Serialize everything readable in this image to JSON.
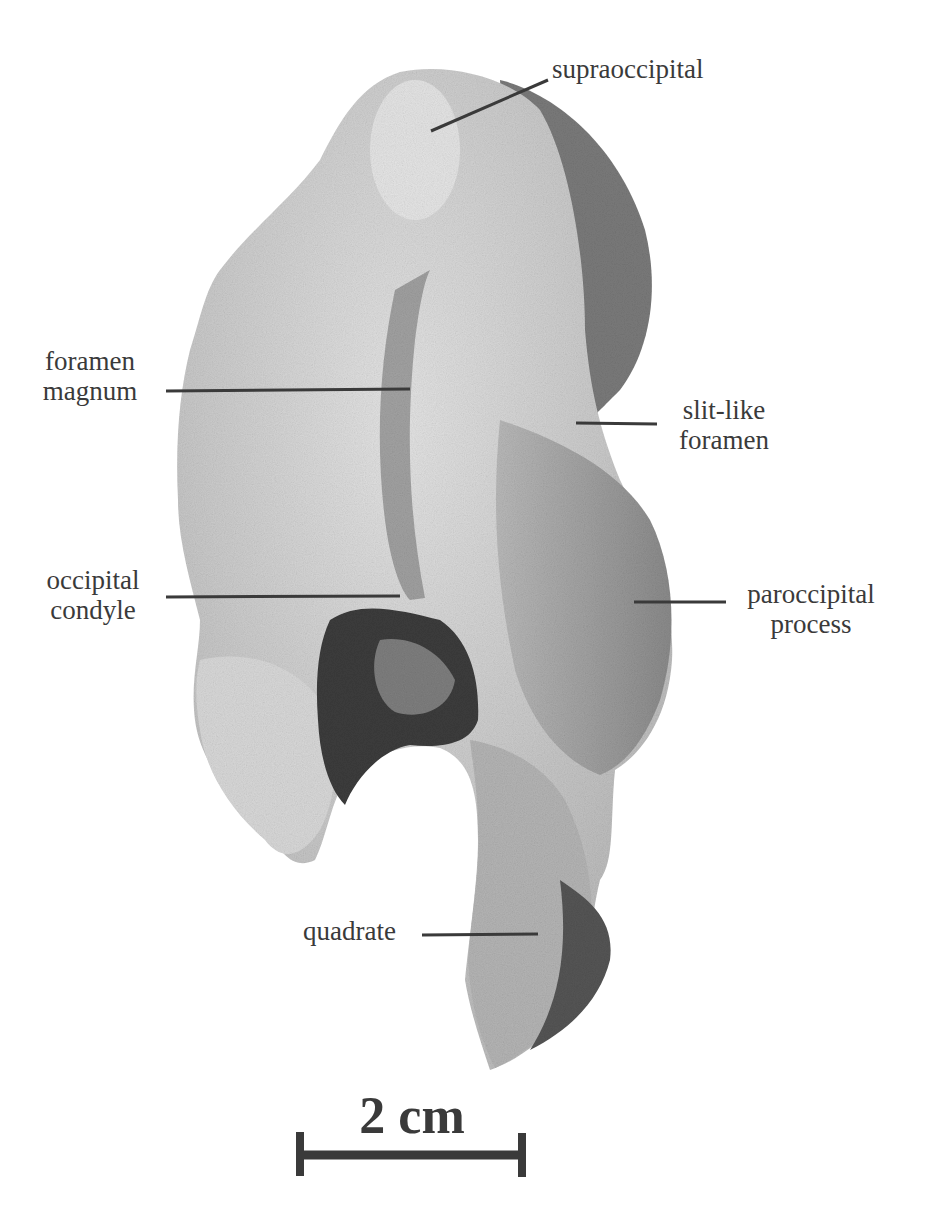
{
  "figure": {
    "type": "annotated specimen photograph (posterior/occipital view of skull)",
    "labels": [
      {
        "id": "supraoccipital",
        "lines": [
          "supraoccipital"
        ]
      },
      {
        "id": "foramen-magnum",
        "lines": [
          "foramen",
          "magnum"
        ]
      },
      {
        "id": "slit-like-foramen",
        "lines": [
          "slit-like",
          "foramen"
        ]
      },
      {
        "id": "occipital-condyle",
        "lines": [
          "occipital",
          "condyle"
        ]
      },
      {
        "id": "paroccipital-process",
        "lines": [
          "paroccipital",
          "process"
        ]
      },
      {
        "id": "quadrate",
        "lines": [
          "quadrate"
        ]
      }
    ],
    "scale_bar": {
      "label": "2 cm"
    }
  }
}
